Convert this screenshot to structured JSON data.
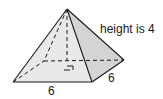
{
  "figure": {
    "labels": {
      "height": "height is 4",
      "base_front_edge": "6",
      "base_side_edge": "6"
    },
    "dimensions": {
      "height": 4,
      "base_length": 6,
      "base_width": 6
    },
    "colors": {
      "front_face": "#e9e9e9",
      "right_face": "#d4d4d4",
      "edge": "#1a1a1a",
      "hidden_edge": "#1a1a1a",
      "background": "#ffffff"
    },
    "vertices": {
      "apex": [
        67,
        9
      ],
      "front_left": [
        13,
        82
      ],
      "front_right": [
        92,
        82
      ],
      "back_right": [
        124,
        60
      ],
      "back_left": [
        44,
        61
      ],
      "height_foot": [
        67,
        61
      ]
    },
    "annotations": {
      "right_angle_marker": "right-angle at foot of height"
    }
  }
}
